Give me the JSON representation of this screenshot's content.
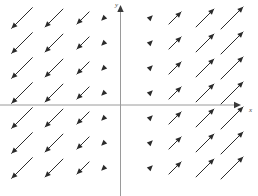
{
  "chart_data": {
    "type": "scatter",
    "plot_kind": "direction-field",
    "title": "",
    "xlabel": "x",
    "ylabel": "y",
    "grid": false,
    "legend": null,
    "xlim": [
      -4.5,
      4.5
    ],
    "ylim": [
      -3.5,
      3.5
    ],
    "origin_px": [
      120,
      105
    ],
    "x_tick_labels": [],
    "y_tick_labels": [],
    "annotations": [],
    "grid_columns_x": [
      -4,
      -3,
      -2,
      -1,
      1,
      2,
      3,
      4
    ],
    "grid_rows_y": [
      3,
      2,
      1,
      0,
      -1,
      -2,
      -3
    ],
    "column_px": [
      22,
      54,
      83,
      104,
      150,
      175,
      205,
      232
    ],
    "row_px": [
      18,
      43,
      68,
      93,
      118,
      143,
      168
    ],
    "column_lengths_px": [
      30,
      26,
      18,
      8,
      8,
      18,
      26,
      32
    ],
    "arrow_angle_deg": 45,
    "series": [
      {
        "name": "negative-x-vectors",
        "direction": "southwest",
        "dx": -1,
        "dy": -1,
        "columns_x": [
          -4,
          -3,
          -2,
          -1
        ],
        "lengths": [
          30,
          26,
          18,
          8
        ]
      },
      {
        "name": "positive-x-vectors",
        "direction": "northeast",
        "dx": 1,
        "dy": 1,
        "columns_x": [
          1,
          2,
          3,
          4
        ],
        "lengths": [
          8,
          18,
          26,
          32
        ]
      }
    ],
    "colors": {
      "background": "#ffffff",
      "arrow": "#2b2b2b",
      "axis": "#9a9a9a",
      "label": "#4a4a4a"
    }
  },
  "labels": {
    "y_axis": "y",
    "x_axis": "x"
  }
}
